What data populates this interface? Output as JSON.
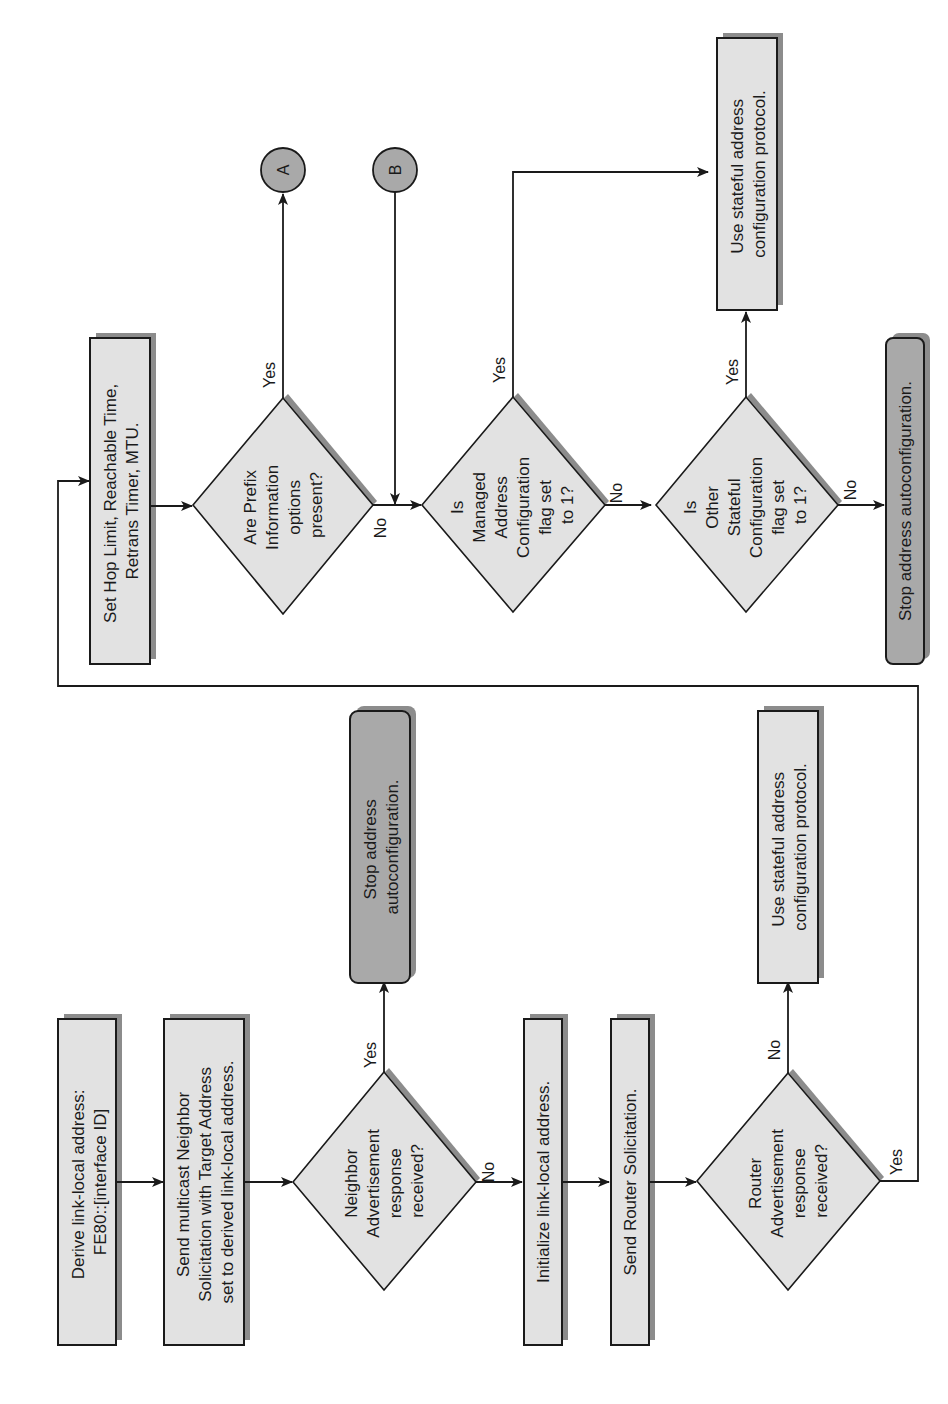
{
  "diagram": {
    "orientation": "rotated-90-ccw",
    "colors": {
      "process_fill": "#e2e2e2",
      "terminal_fill": "#a9a9a9",
      "stroke": "#1a1a1a",
      "shadow": "#8c8c8c"
    },
    "nodes": {
      "derive": {
        "lines": [
          "Derive link-local address:",
          "FE80::[interface ID]"
        ]
      },
      "send_ns": {
        "lines": [
          "Send multicast Neighbor",
          "Solicitation with Target Address",
          "set to derived link-local address."
        ]
      },
      "na_decision": {
        "lines": [
          "Neighbor",
          "Advertisement",
          "response",
          "received?"
        ]
      },
      "stop1": {
        "lines": [
          "Stop address",
          "autoconfiguration."
        ]
      },
      "init_ll": {
        "lines": [
          "Initialize link-local address."
        ]
      },
      "send_rs": {
        "lines": [
          "Send Router Solicitation."
        ]
      },
      "ra_decision": {
        "lines": [
          "Router",
          "Advertisement",
          "response",
          "received?"
        ]
      },
      "stateful1": {
        "lines": [
          "Use stateful address",
          "configuration protocol."
        ]
      },
      "set_params": {
        "lines": [
          "Set Hop Limit, Reachable Time,",
          "Retrans Timer, MTU."
        ]
      },
      "prefix_decision": {
        "lines": [
          "Are Prefix",
          "Information",
          "options",
          "present?"
        ]
      },
      "managed_decision": {
        "lines": [
          "Is",
          "Managed",
          "Address",
          "Configuration",
          "flag set",
          "to 1?"
        ]
      },
      "other_decision": {
        "lines": [
          "Is",
          "Other",
          "Stateful",
          "Configuration",
          "flag set",
          "to 1?"
        ]
      },
      "stateful2": {
        "lines": [
          "Use stateful address",
          "configuration protocol."
        ]
      },
      "stop2": {
        "lines": [
          "Stop address autoconfiguration."
        ]
      },
      "connector_a": {
        "label": "A"
      },
      "connector_b": {
        "label": "B"
      }
    },
    "edge_labels": {
      "na_yes": "Yes",
      "na_no": "No",
      "ra_no": "No",
      "ra_yes": "Yes",
      "prefix_yes": "Yes",
      "prefix_no": "No",
      "managed_yes": "Yes",
      "managed_no": "No",
      "other_yes": "Yes",
      "other_no": "No"
    }
  }
}
